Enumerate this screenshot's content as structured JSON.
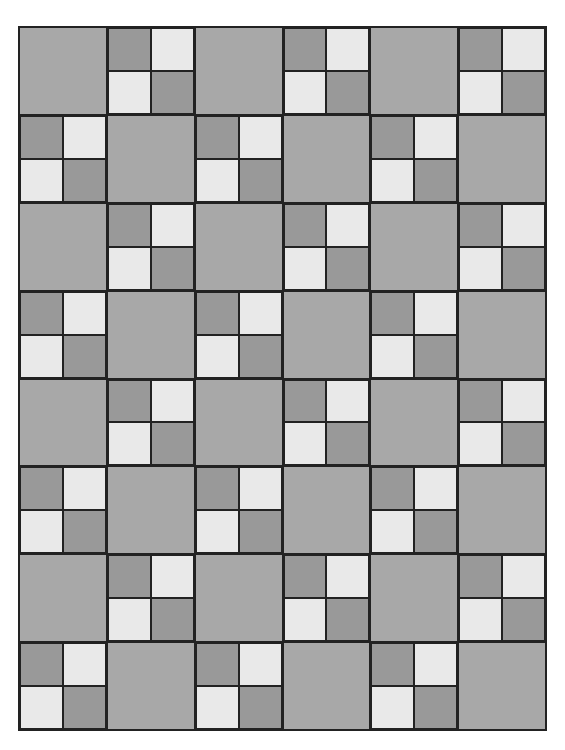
{
  "quilt": {
    "columns": 6,
    "rows": 8,
    "colors": {
      "square": "#a8a8a8",
      "dark": "#999999",
      "light": "#e9e9e9",
      "border": "#222222"
    },
    "four_patch_layout": [
      "dark",
      "light",
      "light",
      "dark"
    ],
    "grid": [
      [
        "square",
        "fourpatch",
        "square",
        "fourpatch",
        "square",
        "fourpatch"
      ],
      [
        "fourpatch",
        "square",
        "fourpatch",
        "square",
        "fourpatch",
        "square"
      ],
      [
        "square",
        "fourpatch",
        "square",
        "fourpatch",
        "square",
        "fourpatch"
      ],
      [
        "fourpatch",
        "square",
        "fourpatch",
        "square",
        "fourpatch",
        "square"
      ],
      [
        "square",
        "fourpatch",
        "square",
        "fourpatch",
        "square",
        "fourpatch"
      ],
      [
        "fourpatch",
        "square",
        "fourpatch",
        "square",
        "fourpatch",
        "square"
      ],
      [
        "square",
        "fourpatch",
        "square",
        "fourpatch",
        "square",
        "fourpatch"
      ],
      [
        "fourpatch",
        "square",
        "fourpatch",
        "square",
        "fourpatch",
        "square"
      ]
    ]
  }
}
